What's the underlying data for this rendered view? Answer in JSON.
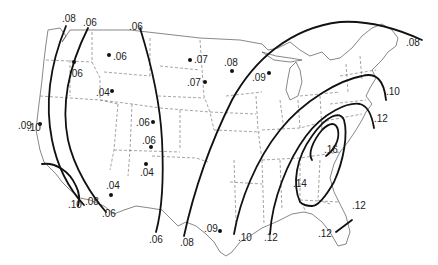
{
  "map": {
    "type": "isoline-map",
    "region": "Contiguous United States",
    "contour_lines": [
      {
        "value": ".08",
        "region": "west coast"
      },
      {
        "value": ".06",
        "region": "west interior"
      },
      {
        "value": ".10",
        "region": "southern California"
      },
      {
        "value": ".08",
        "region": "southern California inner"
      },
      {
        "value": ".06",
        "region": "southwest"
      },
      {
        "value": ".06",
        "region": "Rocky Mountain front"
      },
      {
        "value": ".08",
        "region": "Great Plains to New England"
      },
      {
        "value": ".10",
        "region": "Mississippi valley to northeast"
      },
      {
        "value": ".12",
        "region": "Gulf coast to mid-Atlantic"
      },
      {
        "value": ".14",
        "region": "southeast inner loop"
      },
      {
        "value": ".16",
        "region": "southern Appalachians core"
      },
      {
        "value": ".12",
        "region": "Florida"
      }
    ],
    "labels": {
      "top_08_west": ".08",
      "top_06_west": ".06",
      "top_06_rockies": ".06",
      "ne_08": ".08",
      "ne_10": ".10",
      "ne_12": ".12",
      "left_09": ".09",
      "left_10": ".10",
      "bottom_10": ".10",
      "bottom_08": ".08",
      "bottom_06_sw": ".06",
      "bottom_06": ".06",
      "bottom_08_plains": ".08",
      "bottom_10_east": ".10",
      "bottom_12_east": ".12",
      "se_14": ".14",
      "se_16": ".16",
      "fl_12_a": ".12",
      "fl_12_b": ".12"
    },
    "stations": [
      {
        "value": ".06",
        "location": "Oregon"
      },
      {
        "value": ".06",
        "location": "Idaho/Montana"
      },
      {
        "value": ".04",
        "location": "Idaho"
      },
      {
        "value": ".09",
        "location": "California coast"
      },
      {
        "value": ".06",
        "location": "Colorado north"
      },
      {
        "value": ".06",
        "location": "Colorado"
      },
      {
        "value": ".04",
        "location": "New Mexico"
      },
      {
        "value": ".04",
        "location": "Arizona"
      },
      {
        "value": ".07",
        "location": "North Dakota"
      },
      {
        "value": ".07",
        "location": "South Dakota"
      },
      {
        "value": ".08",
        "location": "Minnesota"
      },
      {
        "value": ".09",
        "location": "Wisconsin"
      },
      {
        "value": ".09",
        "location": "Texas coast"
      }
    ]
  }
}
